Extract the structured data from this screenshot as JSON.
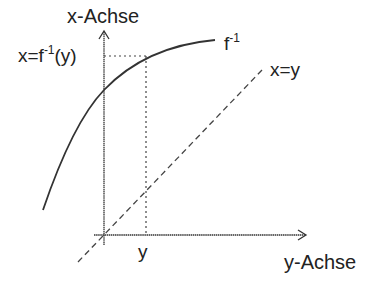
{
  "diagram": {
    "vertical_axis_label": "x-Achse",
    "horizontal_axis_label": "y-Achse",
    "curve_label_base": "f",
    "curve_label_sup": "-1",
    "identity_label": "x=y",
    "point_x_label_pre": "x=f",
    "point_x_label_sup": "-1",
    "point_x_label_post": "(y)",
    "point_y_label": "y",
    "colors": {
      "ink": "#222222",
      "background": "#ffffff"
    }
  }
}
